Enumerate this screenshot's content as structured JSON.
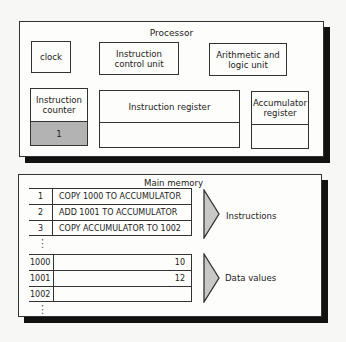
{
  "processor": {
    "title": "Processor",
    "clock": "clock",
    "instruction_control_unit": "Instruction control unit",
    "alu": "Arithmetic and logic unit",
    "instruction_counter": {
      "label": "Instruction counter",
      "value": "1",
      "fill": "#b3b3b3"
    },
    "instruction_register": {
      "label": "Instruction register",
      "value": ""
    },
    "accumulator_register": {
      "label": "Accumulator register",
      "value": ""
    }
  },
  "memory": {
    "title": "Main memory",
    "instructions": [
      {
        "address": "1",
        "content": "COPY 1000 TO ACCUMULATOR"
      },
      {
        "address": "2",
        "content": "ADD 1001 TO ACCUMULATOR"
      },
      {
        "address": "3",
        "content": "COPY ACCUMULATOR TO 1002"
      }
    ],
    "data": [
      {
        "address": "1000",
        "content": "10"
      },
      {
        "address": "1001",
        "content": "12"
      },
      {
        "address": "1002",
        "content": ""
      }
    ],
    "instructions_label": "Instructions",
    "data_label": "Data values",
    "ellipsis": "⋮"
  }
}
